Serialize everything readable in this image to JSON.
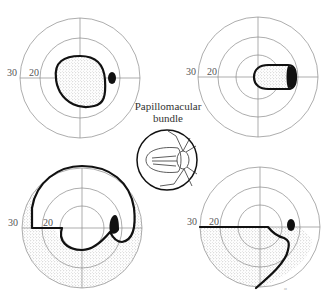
{
  "figure": {
    "caption": {
      "line1": "Papillomacular",
      "line2": "bundle"
    },
    "fields": [
      {
        "id": "top-left",
        "label_outer": "30",
        "label_middle": "20",
        "description": "Central scotoma (stippled) enclosing fixation"
      },
      {
        "id": "top-right",
        "label_outer": "30",
        "label_middle": "20",
        "description": "Cecocentral scotoma extending to blind spot"
      },
      {
        "id": "bottom-left",
        "label_outer": "30",
        "label_middle": "20",
        "description": "Arcuate defect with stippled periphery"
      },
      {
        "id": "bottom-right",
        "label_outer": "30",
        "label_middle": "20",
        "description": "Inferior altitudinal defect"
      }
    ],
    "signature": "ᵃᵗ"
  },
  "colors": {
    "grid": "#8a8a8a",
    "defect_line": "#111111",
    "stipple": "#bdbdbd"
  }
}
